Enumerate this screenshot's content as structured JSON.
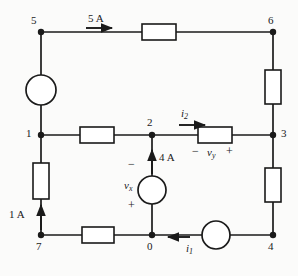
{
  "figure": {
    "type": "electrical-circuit-diagram",
    "stroke_color": "#1a1a1a",
    "background_color": "#fbfbfa"
  },
  "nodes": [
    {
      "id": "5",
      "label": "5",
      "x": 41,
      "y": 32,
      "label_x": 31,
      "label_y": 15
    },
    {
      "id": "6",
      "label": "6",
      "x": 273,
      "y": 32,
      "label_x": 268,
      "label_y": 15
    },
    {
      "id": "1",
      "label": "1",
      "x": 41,
      "y": 135,
      "label_x": 27,
      "label_y": 128
    },
    {
      "id": "2",
      "label": "2",
      "x": 152,
      "y": 135,
      "label_x": 146,
      "label_y": 119
    },
    {
      "id": "3",
      "label": "3",
      "x": 273,
      "y": 135,
      "label_x": 281,
      "label_y": 128
    },
    {
      "id": "7",
      "label": "7",
      "x": 41,
      "y": 235,
      "label_x": 35,
      "label_y": 243
    },
    {
      "id": "0",
      "label": "0",
      "x": 152,
      "y": 235,
      "label_x": 146,
      "label_y": 243
    },
    {
      "id": "4",
      "label": "4",
      "x": 273,
      "y": 235,
      "label_x": 268,
      "label_y": 243
    }
  ],
  "resistors": [
    {
      "name": "top-resistor",
      "orientation": "horizontal",
      "x": 142,
      "y": 24,
      "w": 34,
      "h": 16
    },
    {
      "name": "right-upper-resistor",
      "orientation": "vertical",
      "x": 265,
      "y": 70,
      "w": 16,
      "h": 34
    },
    {
      "name": "middle-left-resistor",
      "orientation": "horizontal",
      "x": 80,
      "y": 127,
      "w": 34,
      "h": 16
    },
    {
      "name": "vy-resistor",
      "orientation": "horizontal",
      "x": 198,
      "y": 127,
      "w": 34,
      "h": 16
    },
    {
      "name": "right-lower-resistor",
      "orientation": "vertical",
      "x": 265,
      "y": 168,
      "w": 16,
      "h": 34
    },
    {
      "name": "left-lower-resistor",
      "orientation": "vertical",
      "x": 33,
      "y": 163,
      "w": 16,
      "h": 36
    },
    {
      "name": "bottom-resistor",
      "orientation": "horizontal",
      "x": 82,
      "y": 227,
      "w": 32,
      "h": 16
    }
  ],
  "sources": [
    {
      "name": "left-current-source",
      "cx": 41,
      "cy": 90,
      "r": 15
    },
    {
      "name": "vx-current-source",
      "cx": 152,
      "cy": 190,
      "r": 14
    },
    {
      "name": "bottom-right-current-source",
      "cx": 216,
      "cy": 235,
      "r": 14
    }
  ],
  "annotations": {
    "current_5a": {
      "label": "5 A",
      "x": 88,
      "y": 14
    },
    "current_4a": {
      "label": "4 A",
      "x": 160,
      "y": 156
    },
    "current_1a": {
      "label": "1 A",
      "x": 10,
      "y": 212
    },
    "current_i2": {
      "label": "i",
      "subscript": "2",
      "x": 178,
      "y": 112
    },
    "current_i1": {
      "label": "i",
      "subscript": "1",
      "x": 187,
      "y": 245
    },
    "voltage_vx": {
      "label": "v",
      "subscript": "x",
      "x": 125,
      "y": 183
    },
    "voltage_vy": {
      "label": "v",
      "subscript": "y",
      "x": 208,
      "y": 149
    },
    "vx_minus": {
      "label": "−",
      "x": 130,
      "y": 163
    },
    "vx_plus": {
      "label": "+",
      "x": 130,
      "y": 202
    },
    "vy_minus": {
      "label": "−",
      "x": 193,
      "y": 148
    },
    "vy_plus": {
      "label": "+",
      "x": 226,
      "y": 148
    }
  }
}
